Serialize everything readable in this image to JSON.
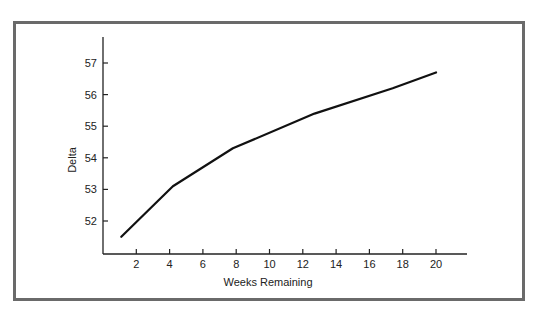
{
  "chart_data": {
    "type": "line",
    "title": "",
    "xlabel": "Weeks Remaining",
    "ylabel": "Delta",
    "x_ticks": [
      2,
      4,
      6,
      8,
      10,
      12,
      14,
      16,
      18,
      20
    ],
    "y_ticks": [
      52,
      53,
      54,
      55,
      56,
      57
    ],
    "xlim": [
      0,
      22
    ],
    "ylim": [
      51,
      57.8
    ],
    "grid": false,
    "legend": null,
    "series": [
      {
        "name": "Delta",
        "color": "#111111",
        "x": [
          1.1,
          4.2,
          7.8,
          12.7,
          17.4,
          20.0
        ],
        "y": [
          51.5,
          53.1,
          54.3,
          55.4,
          56.2,
          56.7
        ]
      }
    ]
  },
  "axes": {
    "x_title": "Weeks Remaining",
    "y_title": "Delta"
  },
  "colors": {
    "frame": "#6a6a6a",
    "axis": "#222222",
    "line": "#111111"
  }
}
